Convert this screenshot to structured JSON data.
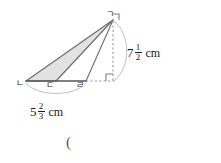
{
  "figure": {
    "type": "geometry-diagram",
    "colors": {
      "shade_fill": "#e2e2e2",
      "stroke": "#6e6e6e",
      "base_stroke": "#555555",
      "dashed_stroke": "#9a9a9a",
      "arc_stroke": "#b4b4b4",
      "text": "#1a1a1a"
    },
    "vertices": [
      {
        "name": "apex",
        "label": "ㄱ",
        "x": 113,
        "y": 20
      },
      {
        "name": "base-left",
        "label": "ㄴ",
        "x": 26,
        "y": 81
      },
      {
        "name": "base-mid",
        "label": "ㄷ",
        "x": 56,
        "y": 81
      },
      {
        "name": "base-right",
        "label": "ㄹ",
        "x": 86,
        "y": 81
      },
      {
        "name": "foot-of-height",
        "label": "",
        "x": 113,
        "y": 81
      }
    ],
    "vertical_dimension": {
      "whole": "7",
      "numerator": "1",
      "denominator": "2",
      "unit": "cm"
    },
    "base_dimension": {
      "whole": "5",
      "numerator": "2",
      "denominator": "3",
      "unit": "cm"
    },
    "right_angle_marker": true,
    "trailing_text": "("
  }
}
